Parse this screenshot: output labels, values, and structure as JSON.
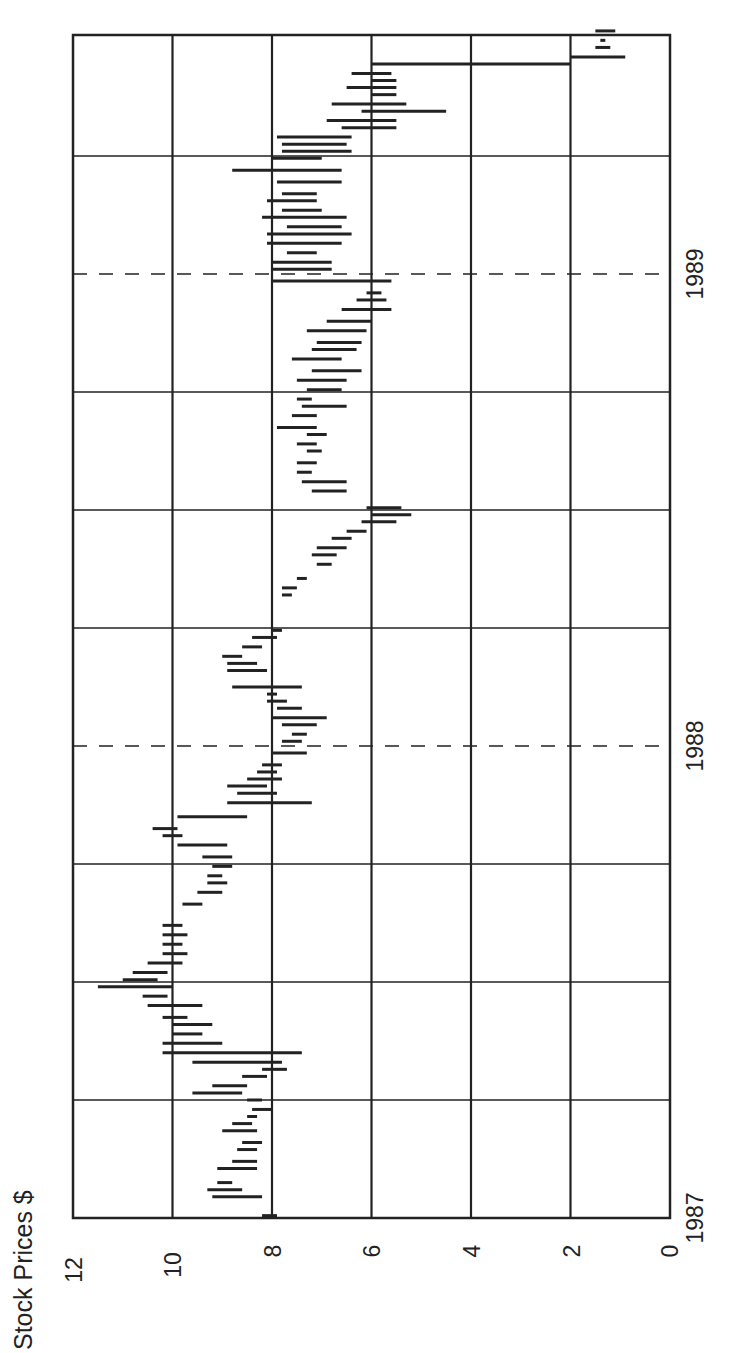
{
  "chart_data": {
    "type": "bar",
    "subtype": "high-low range (rotated 90° counter-clockwise)",
    "title": "",
    "ylabel": "Stock Prices $",
    "xlabel": "",
    "ylim": [
      0,
      12
    ],
    "yticks": [
      "0",
      "2",
      "4",
      "6",
      "8",
      "10",
      "12"
    ],
    "xticks": [
      {
        "label": "1987",
        "t": 0.0
      },
      {
        "label": "1988",
        "t": 1.0
      },
      {
        "label": "1989",
        "t": 2.0
      }
    ],
    "xlim": [
      0,
      2.43
    ],
    "grid": {
      "quarter_lines": true,
      "year_lines_dashed": true
    },
    "legend": null,
    "series": [
      {
        "name": "High-Low",
        "bars": [
          {
            "t": 0.005,
            "high": 8.2,
            "low": 7.9
          },
          {
            "t": 0.045,
            "high": 9.2,
            "low": 8.2
          },
          {
            "t": 0.06,
            "high": 9.3,
            "low": 8.6
          },
          {
            "t": 0.075,
            "high": 9.1,
            "low": 8.8
          },
          {
            "t": 0.105,
            "high": 9.1,
            "low": 8.3
          },
          {
            "t": 0.12,
            "high": 8.8,
            "low": 8.3
          },
          {
            "t": 0.145,
            "high": 8.7,
            "low": 8.3
          },
          {
            "t": 0.16,
            "high": 8.6,
            "low": 8.2
          },
          {
            "t": 0.185,
            "high": 9.0,
            "low": 8.3
          },
          {
            "t": 0.2,
            "high": 8.8,
            "low": 8.4
          },
          {
            "t": 0.215,
            "high": 8.5,
            "low": 8.3
          },
          {
            "t": 0.23,
            "high": 8.4,
            "low": 8.0
          },
          {
            "t": 0.25,
            "high": 8.5,
            "low": 8.2
          },
          {
            "t": 0.265,
            "high": 9.6,
            "low": 8.6
          },
          {
            "t": 0.28,
            "high": 9.2,
            "low": 8.5
          },
          {
            "t": 0.3,
            "high": 8.6,
            "low": 8.1
          },
          {
            "t": 0.315,
            "high": 8.2,
            "low": 7.7
          },
          {
            "t": 0.33,
            "high": 9.6,
            "low": 7.8
          },
          {
            "t": 0.35,
            "high": 10.2,
            "low": 7.4
          },
          {
            "t": 0.37,
            "high": 10.2,
            "low": 9.0
          },
          {
            "t": 0.39,
            "high": 10.0,
            "low": 9.4
          },
          {
            "t": 0.41,
            "high": 10.0,
            "low": 9.2
          },
          {
            "t": 0.425,
            "high": 10.2,
            "low": 9.7
          },
          {
            "t": 0.45,
            "high": 10.5,
            "low": 9.4
          },
          {
            "t": 0.47,
            "high": 10.6,
            "low": 10.1
          },
          {
            "t": 0.49,
            "high": 11.5,
            "low": 10.0
          },
          {
            "t": 0.505,
            "high": 11.0,
            "low": 10.3
          },
          {
            "t": 0.52,
            "high": 10.8,
            "low": 10.1
          },
          {
            "t": 0.54,
            "high": 10.5,
            "low": 9.8
          },
          {
            "t": 0.56,
            "high": 10.2,
            "low": 9.7
          },
          {
            "t": 0.58,
            "high": 10.2,
            "low": 9.8
          },
          {
            "t": 0.6,
            "high": 10.2,
            "low": 9.7
          },
          {
            "t": 0.62,
            "high": 10.2,
            "low": 9.8
          },
          {
            "t": 0.665,
            "high": 9.8,
            "low": 9.4
          },
          {
            "t": 0.69,
            "high": 9.5,
            "low": 9.0
          },
          {
            "t": 0.71,
            "high": 9.3,
            "low": 8.9
          },
          {
            "t": 0.725,
            "high": 9.3,
            "low": 9.0
          },
          {
            "t": 0.745,
            "high": 9.2,
            "low": 8.8
          },
          {
            "t": 0.765,
            "high": 9.4,
            "low": 8.8
          },
          {
            "t": 0.79,
            "high": 9.9,
            "low": 8.9
          },
          {
            "t": 0.81,
            "high": 10.2,
            "low": 9.8
          },
          {
            "t": 0.825,
            "high": 10.4,
            "low": 9.9
          },
          {
            "t": 0.85,
            "high": 9.9,
            "low": 8.5
          },
          {
            "t": 0.88,
            "high": 8.9,
            "low": 7.2
          },
          {
            "t": 0.9,
            "high": 8.7,
            "low": 7.9
          },
          {
            "t": 0.915,
            "high": 8.9,
            "low": 8.1
          },
          {
            "t": 0.93,
            "high": 8.5,
            "low": 7.8
          },
          {
            "t": 0.945,
            "high": 8.3,
            "low": 7.9
          },
          {
            "t": 0.96,
            "high": 8.2,
            "low": 7.8
          },
          {
            "t": 0.985,
            "high": 8.0,
            "low": 7.3
          },
          {
            "t": 1.01,
            "high": 7.8,
            "low": 7.4
          },
          {
            "t": 1.025,
            "high": 7.6,
            "low": 7.3
          },
          {
            "t": 1.045,
            "high": 7.8,
            "low": 7.1
          },
          {
            "t": 1.06,
            "high": 8.0,
            "low": 6.9
          },
          {
            "t": 1.08,
            "high": 7.9,
            "low": 7.4
          },
          {
            "t": 1.095,
            "high": 8.1,
            "low": 7.7
          },
          {
            "t": 1.11,
            "high": 8.1,
            "low": 7.9
          },
          {
            "t": 1.125,
            "high": 8.8,
            "low": 7.4
          },
          {
            "t": 1.16,
            "high": 8.9,
            "low": 8.1
          },
          {
            "t": 1.175,
            "high": 8.9,
            "low": 8.3
          },
          {
            "t": 1.19,
            "high": 9.0,
            "low": 8.6
          },
          {
            "t": 1.21,
            "high": 8.6,
            "low": 8.2
          },
          {
            "t": 1.23,
            "high": 8.4,
            "low": 7.9
          },
          {
            "t": 1.245,
            "high": 8.0,
            "low": 7.8
          },
          {
            "t": 1.32,
            "high": 7.8,
            "low": 7.6
          },
          {
            "t": 1.335,
            "high": 7.8,
            "low": 7.5
          },
          {
            "t": 1.355,
            "high": 7.5,
            "low": 7.3
          },
          {
            "t": 1.385,
            "high": 7.1,
            "low": 6.8
          },
          {
            "t": 1.405,
            "high": 7.2,
            "low": 6.7
          },
          {
            "t": 1.42,
            "high": 7.1,
            "low": 6.5
          },
          {
            "t": 1.44,
            "high": 6.8,
            "low": 6.4
          },
          {
            "t": 1.455,
            "high": 6.5,
            "low": 6.1
          },
          {
            "t": 1.475,
            "high": 6.2,
            "low": 5.5
          },
          {
            "t": 1.49,
            "high": 6.0,
            "low": 5.2
          },
          {
            "t": 1.505,
            "high": 6.1,
            "low": 5.4
          },
          {
            "t": 1.54,
            "high": 7.2,
            "low": 6.5
          },
          {
            "t": 1.56,
            "high": 7.4,
            "low": 6.5
          },
          {
            "t": 1.58,
            "high": 7.5,
            "low": 7.2
          },
          {
            "t": 1.6,
            "high": 7.5,
            "low": 7.1
          },
          {
            "t": 1.625,
            "high": 7.3,
            "low": 7.0
          },
          {
            "t": 1.64,
            "high": 7.5,
            "low": 7.1
          },
          {
            "t": 1.66,
            "high": 7.3,
            "low": 6.9
          },
          {
            "t": 1.675,
            "high": 7.9,
            "low": 7.1
          },
          {
            "t": 1.7,
            "high": 7.6,
            "low": 7.1
          },
          {
            "t": 1.72,
            "high": 7.4,
            "low": 6.5
          },
          {
            "t": 1.735,
            "high": 7.5,
            "low": 7.2
          },
          {
            "t": 1.755,
            "high": 7.3,
            "low": 6.6
          },
          {
            "t": 1.775,
            "high": 7.5,
            "low": 6.5
          },
          {
            "t": 1.795,
            "high": 7.2,
            "low": 6.2
          },
          {
            "t": 1.82,
            "high": 7.6,
            "low": 6.6
          },
          {
            "t": 1.84,
            "high": 7.2,
            "low": 6.3
          },
          {
            "t": 1.855,
            "high": 7.1,
            "low": 6.2
          },
          {
            "t": 1.88,
            "high": 7.3,
            "low": 6.1
          },
          {
            "t": 1.9,
            "high": 6.9,
            "low": 6.0
          },
          {
            "t": 1.925,
            "high": 6.6,
            "low": 5.6
          },
          {
            "t": 1.945,
            "high": 6.3,
            "low": 5.7
          },
          {
            "t": 1.96,
            "high": 6.1,
            "low": 5.8
          },
          {
            "t": 1.985,
            "high": 8.0,
            "low": 5.6
          },
          {
            "t": 2.01,
            "high": 8.0,
            "low": 6.8
          },
          {
            "t": 2.025,
            "high": 8.0,
            "low": 6.8
          },
          {
            "t": 2.045,
            "high": 7.7,
            "low": 7.1
          },
          {
            "t": 2.065,
            "high": 8.1,
            "low": 6.6
          },
          {
            "t": 2.085,
            "high": 8.1,
            "low": 6.4
          },
          {
            "t": 2.1,
            "high": 7.7,
            "low": 6.6
          },
          {
            "t": 2.12,
            "high": 8.2,
            "low": 6.5
          },
          {
            "t": 2.135,
            "high": 7.8,
            "low": 7.0
          },
          {
            "t": 2.155,
            "high": 8.1,
            "low": 7.1
          },
          {
            "t": 2.17,
            "high": 7.8,
            "low": 7.1
          },
          {
            "t": 2.195,
            "high": 7.9,
            "low": 6.6
          },
          {
            "t": 2.22,
            "high": 8.8,
            "low": 6.6
          },
          {
            "t": 2.245,
            "high": 8.0,
            "low": 7.0
          },
          {
            "t": 2.26,
            "high": 7.8,
            "low": 6.4
          },
          {
            "t": 2.275,
            "high": 7.8,
            "low": 6.5
          },
          {
            "t": 2.29,
            "high": 7.9,
            "low": 6.4
          },
          {
            "t": 2.31,
            "high": 6.6,
            "low": 5.5
          },
          {
            "t": 2.325,
            "high": 6.9,
            "low": 5.5
          },
          {
            "t": 2.345,
            "high": 6.2,
            "low": 4.5
          },
          {
            "t": 2.36,
            "high": 6.8,
            "low": 5.3
          },
          {
            "t": 2.38,
            "high": 6.0,
            "low": 5.5
          },
          {
            "t": 2.395,
            "high": 6.5,
            "low": 5.5
          },
          {
            "t": 2.41,
            "high": 6.0,
            "low": 5.5
          },
          {
            "t": 2.425,
            "high": 6.4,
            "low": 5.6
          },
          {
            "t": 2.445,
            "high": 6.0,
            "low": 2.0
          },
          {
            "t": 2.46,
            "high": 2.0,
            "low": 0.9
          },
          {
            "t": 2.48,
            "high": 1.5,
            "low": 1.2
          },
          {
            "t": 2.495,
            "high": 1.4,
            "low": 1.3
          },
          {
            "t": 2.515,
            "high": 1.5,
            "low": 1.1
          }
        ]
      }
    ]
  },
  "labels": {
    "ylabel": "Stock Prices $",
    "ytick_0": "0",
    "ytick_2": "2",
    "ytick_4": "4",
    "ytick_6": "6",
    "ytick_8": "8",
    "ytick_10": "10",
    "ytick_12": "12",
    "xtick_1987": "1987",
    "xtick_1988": "1988",
    "xtick_1989": "1989"
  },
  "colors": {
    "line": "#222222",
    "grid": "#333333",
    "background": "#ffffff"
  }
}
